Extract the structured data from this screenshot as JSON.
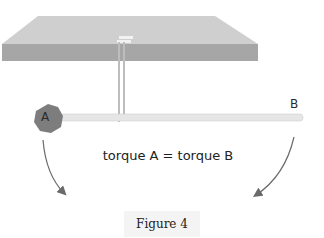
{
  "diagram": {
    "label_a": "A",
    "label_b": "B",
    "equation": "torque A = torque B",
    "caption": "Figure 4",
    "colors": {
      "slab_top": "#cfcfcf",
      "slab_front": "#a6a6a6",
      "rod": "#e6e6e6",
      "ball": "#7d7d7d",
      "arrow": "#6a6a6a"
    }
  }
}
